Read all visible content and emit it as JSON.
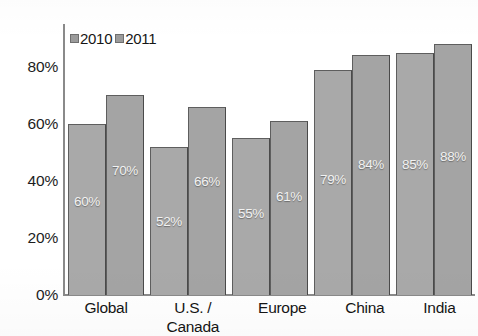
{
  "chart_data": {
    "type": "bar",
    "title": "",
    "xlabel": "",
    "ylabel": "",
    "categories": [
      "Global",
      "U.S. / Canada",
      "Europe",
      "China",
      "India"
    ],
    "category_lines": [
      [
        "Global"
      ],
      [
        "U.S. /",
        "Canada"
      ],
      [
        "Europe"
      ],
      [
        "China"
      ],
      [
        "India"
      ]
    ],
    "series": [
      {
        "name": "2010",
        "values": [
          60,
          70,
          52,
          66,
          55
        ]
      },
      {
        "name": "2011",
        "values": [
          61,
          79,
          84,
          85,
          88
        ]
      }
    ],
    "series_display": [
      {
        "name": "2010",
        "values": [
          60,
          52,
          55,
          79,
          85
        ],
        "labels": [
          "60%",
          "52%",
          "55%",
          "79%",
          "85%"
        ],
        "color": "#a9a9a9"
      },
      {
        "name": "2011",
        "values": [
          70,
          66,
          61,
          84,
          88
        ],
        "labels": [
          "70%",
          "66%",
          "61%",
          "84%",
          "88%"
        ],
        "color": "#a4a4a4"
      }
    ],
    "ylim": [
      0,
      95
    ],
    "yticks": [
      0,
      20,
      40,
      60,
      80
    ],
    "ytick_labels": [
      "0%",
      "20%",
      "40%",
      "60%",
      "80%"
    ],
    "grid": false,
    "legend_position": "top-left-inside",
    "value_labels_inside_bars": true,
    "axis_color": "#8a8a8a",
    "background": "#ffffff"
  },
  "legend": {
    "items": [
      {
        "label": "2010",
        "swatch": "legend-swatch-2010"
      },
      {
        "label": "2011",
        "swatch": "legend-swatch-2011"
      }
    ]
  },
  "yaxis": {
    "ticks": [
      {
        "label": "80%",
        "value": 80
      },
      {
        "label": "60%",
        "value": 60
      },
      {
        "label": "40%",
        "value": 40
      },
      {
        "label": "20%",
        "value": 20
      },
      {
        "label": "0%",
        "value": 0
      }
    ]
  },
  "xaxis": {
    "categories": [
      {
        "lines": [
          "Global"
        ]
      },
      {
        "lines": [
          "U.S. /",
          "Canada"
        ]
      },
      {
        "lines": [
          "Europe"
        ]
      },
      {
        "lines": [
          "China"
        ]
      },
      {
        "lines": [
          "India"
        ]
      }
    ]
  },
  "bars": [
    {
      "category": "Global",
      "series": "2010",
      "value": 60,
      "label": "60%",
      "label_offset_pct": 30
    },
    {
      "category": "Global",
      "series": "2011",
      "value": 70,
      "label": "70%",
      "label_offset_pct": 41
    },
    {
      "category": "U.S. / Canada",
      "series": "2010",
      "value": 52,
      "label": "52%",
      "label_offset_pct": 23
    },
    {
      "category": "U.S. / Canada",
      "series": "2011",
      "value": 66,
      "label": "66%",
      "label_offset_pct": 37
    },
    {
      "category": "Europe",
      "series": "2010",
      "value": 55,
      "label": "55%",
      "label_offset_pct": 26
    },
    {
      "category": "Europe",
      "series": "2011",
      "value": 61,
      "label": "61%",
      "label_offset_pct": 32
    },
    {
      "category": "China",
      "series": "2010",
      "value": 79,
      "label": "79%",
      "label_offset_pct": 38
    },
    {
      "category": "China",
      "series": "2011",
      "value": 84,
      "label": "84%",
      "label_offset_pct": 43
    },
    {
      "category": "India",
      "series": "2010",
      "value": 85,
      "label": "85%",
      "label_offset_pct": 43
    },
    {
      "category": "India",
      "series": "2011",
      "value": 88,
      "label": "88%",
      "label_offset_pct": 46
    }
  ]
}
